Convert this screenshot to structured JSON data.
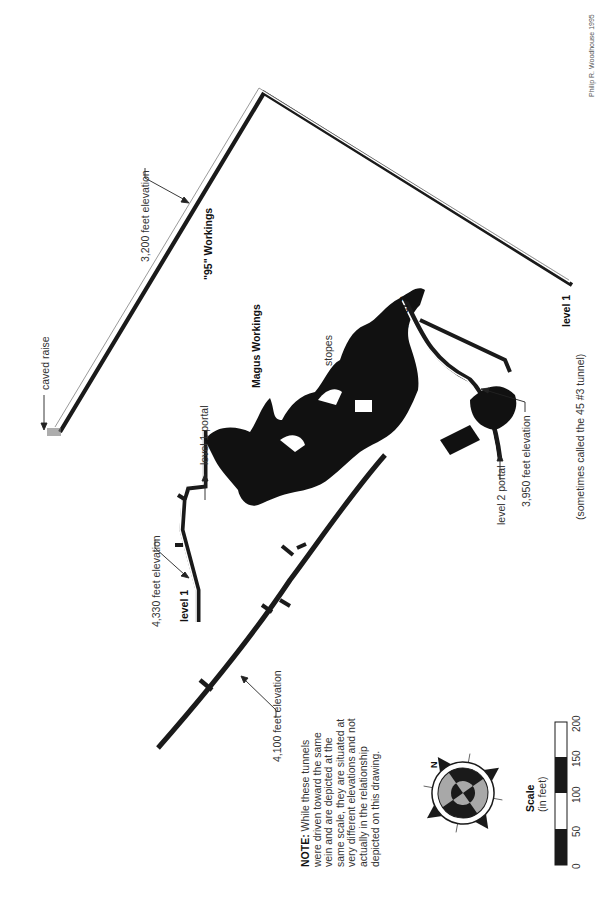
{
  "credit": "Philip R. Woodhouse 1995",
  "labels": {
    "caved_raise": "caved raise",
    "elev_3200": "3,200 feet elevation",
    "workings_95": "\"95\" Workings",
    "magus_workings": "Magus Workings",
    "level1_portal": "level 1 portal",
    "stopes": "stopes",
    "level2": "level 2",
    "level1_right": "level 1",
    "level1_right_sub": "(sometimes called the 45 #3 tunnel)",
    "level2_portal": "level 2 portal",
    "elev_3950": "3,950 feet elevation",
    "elev_4330": "4,330 feet elevation",
    "level1_left": "level 1",
    "elev_4100": "4,100 feet elevation"
  },
  "note": {
    "lead": "NOTE:",
    "text": "While these tunnels were driven toward the same vein and are depicted at the same scale, they are situated at very different elevations and not actually in the relationship depicted on this drawing."
  },
  "compass": {
    "north_label": "N",
    "grey": "#a8a8a8",
    "dark": "#1a1a1a"
  },
  "scale": {
    "title": "Scale",
    "unit": "(in feet)",
    "ticks": [
      "0",
      "50",
      "100",
      "150",
      "200"
    ]
  }
}
